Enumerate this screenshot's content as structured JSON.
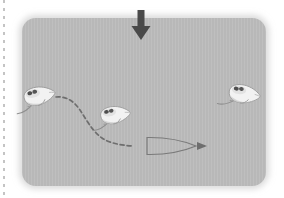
{
  "figure": {
    "type": "behavioral-arena-schematic",
    "caption": "",
    "arena": {
      "label": "test arena",
      "shape": "rounded-rectangle",
      "fill_color": "#bcbcbc",
      "x": 22,
      "y": 18,
      "width": 244,
      "height": 168,
      "corner_radius": 14
    },
    "left_margin_rule": {
      "label": "page margin dotted rule",
      "color": "#b9b9b9"
    },
    "stimulus_arrow": {
      "label": "overhead stimulus arrow",
      "direction": "down",
      "color": "#4a4a4a",
      "x": 141,
      "y_top": 10,
      "y_tip": 40
    },
    "trajectory": {
      "label": "dashed movement trajectory",
      "color": "#6e6e6e",
      "style": "dashed",
      "dash_pattern": "4 3",
      "start": [
        56,
        98
      ],
      "end": [
        208,
        146
      ],
      "has_arrowhead": true
    },
    "object": {
      "label": "lens-shaped object",
      "shape": "lens",
      "outline_color": "#7a7a7a",
      "fill": "none",
      "cx": 172,
      "cy": 146,
      "rx": 26,
      "ry": 9
    },
    "subjects": [
      {
        "id": "mouse-left",
        "label": "mouse at start position",
        "x": 38,
        "y": 96,
        "rotation": -12,
        "scale": 1.0
      },
      {
        "id": "mouse-middle",
        "label": "mouse at mid trajectory",
        "x": 114,
        "y": 115,
        "rotation": -8,
        "scale": 0.95
      },
      {
        "id": "mouse-right",
        "label": "mouse at right position",
        "x": 243,
        "y": 94,
        "rotation": 8,
        "scale": 1.0
      }
    ]
  }
}
